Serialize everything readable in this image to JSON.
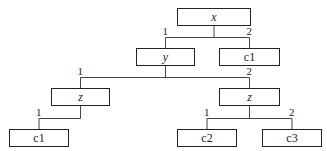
{
  "diagram": {
    "type": "decision-tree",
    "nodes": [
      {
        "id": "n_x",
        "label": "x",
        "kind": "variable",
        "x": 177,
        "y": 8,
        "w": 74,
        "h": 18
      },
      {
        "id": "n_y",
        "label": "y",
        "kind": "variable",
        "x": 136,
        "y": 48,
        "w": 59,
        "h": 18
      },
      {
        "id": "n_c1a",
        "label": "c1",
        "kind": "leaf",
        "x": 219,
        "y": 48,
        "w": 61,
        "h": 18
      },
      {
        "id": "n_z1",
        "label": "z",
        "kind": "variable",
        "x": 51,
        "y": 88,
        "w": 59,
        "h": 18
      },
      {
        "id": "n_z2",
        "label": "z",
        "kind": "variable",
        "x": 219,
        "y": 88,
        "w": 61,
        "h": 18
      },
      {
        "id": "n_c1b",
        "label": "c1",
        "kind": "leaf",
        "x": 9,
        "y": 129,
        "w": 60,
        "h": 18
      },
      {
        "id": "n_c2",
        "label": "c2",
        "kind": "leaf",
        "x": 177,
        "y": 129,
        "w": 60,
        "h": 18
      },
      {
        "id": "n_c3",
        "label": "c3",
        "kind": "leaf",
        "x": 262,
        "y": 129,
        "w": 60,
        "h": 18
      }
    ],
    "edges": [
      {
        "from": "n_x",
        "to": "n_y",
        "label": "1"
      },
      {
        "from": "n_x",
        "to": "n_c1a",
        "label": "2"
      },
      {
        "from": "n_y",
        "to": "n_z1",
        "label": "1"
      },
      {
        "from": "n_y",
        "to": "n_z2",
        "label": "2"
      },
      {
        "from": "n_z1",
        "to": "n_c1b",
        "label": "1"
      },
      {
        "from": "n_z2",
        "to": "n_c2",
        "label": "1"
      },
      {
        "from": "n_z2",
        "to": "n_c3",
        "label": "2"
      }
    ],
    "colors": {
      "line": "#444444",
      "border": "#222222",
      "text": "#222222"
    }
  }
}
